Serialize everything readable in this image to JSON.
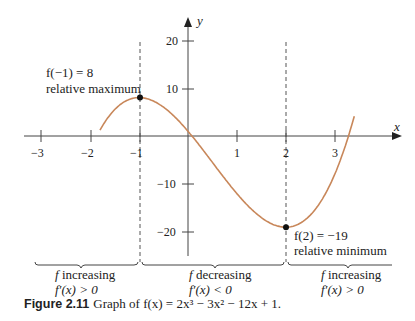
{
  "chart_data": {
    "type": "line",
    "function": "2x^3 - 3x^2 - 12x + 1",
    "xlabel": "x",
    "ylabel": "y",
    "xlim": [
      -3.5,
      3.7
    ],
    "ylim": [
      -25,
      25
    ],
    "x_ticks": [
      -3,
      -2,
      -1,
      1,
      2,
      3
    ],
    "y_ticks": [
      20,
      10,
      -10,
      -20
    ],
    "curve_domain": [
      -1.8,
      3.4
    ],
    "series": [
      {
        "name": "f(x)",
        "color": "#c8875a",
        "x": [
          -1.8,
          -1.5,
          -1,
          -0.5,
          0,
          0.5,
          1,
          1.5,
          2,
          2.5,
          3,
          3.4
        ],
        "y": [
          -0.4,
          5.5,
          8,
          6,
          1,
          -5.5,
          -12,
          -17,
          -19,
          -16.5,
          -8,
          4.1
        ]
      }
    ],
    "critical_points": [
      {
        "x": -1,
        "y": 8,
        "label": "f(−1) = 8",
        "note": "relative maximum"
      },
      {
        "x": 2,
        "y": -19,
        "label": "f(2) = −19",
        "note": "relative minimum"
      }
    ],
    "intervals": [
      {
        "label": "f increasing",
        "condition": "f′(x) > 0"
      },
      {
        "label": "f decreasing",
        "condition": "f′(x) < 0"
      },
      {
        "label": "f increasing",
        "condition": "f′(x) > 0"
      }
    ],
    "grid": false
  },
  "axes": {
    "x_label": "x",
    "y_label": "y",
    "x_ticks": [
      "−3",
      "−2",
      "−1",
      "1",
      "2",
      "3"
    ],
    "y_ticks": [
      "20",
      "10",
      "−10",
      "−20"
    ]
  },
  "annotations": {
    "max_value": "f(−1) = 8",
    "max_note": "relative maximum",
    "min_value": "f(2) = −19",
    "min_note": "relative minimum"
  },
  "intervals": [
    {
      "f": "f",
      "text": " increasing",
      "deriv": "f′(x) > 0"
    },
    {
      "f": "f",
      "text": " decreasing",
      "deriv": "f′(x) < 0"
    },
    {
      "f": "f",
      "text": " increasing",
      "deriv": "f′(x) > 0"
    }
  ],
  "caption": {
    "label": "Figure 2.11",
    "text": "Graph of f(x) = 2x³ − 3x² − 12x + 1."
  },
  "colors": {
    "curve": "#c8875a",
    "axis": "#444444",
    "text": "#222222"
  }
}
